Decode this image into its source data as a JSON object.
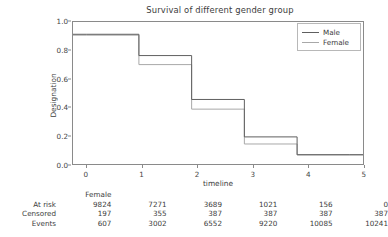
{
  "chart_data": {
    "type": "line",
    "title": "Survival of different gender group",
    "xlabel": "timeline",
    "ylabel": "Designation",
    "xlim": [
      -0.25,
      5.25
    ],
    "ylim": [
      -0.05,
      1.05
    ],
    "grid": false,
    "legend_position": "upper right",
    "x_ticks": [
      "0",
      "1",
      "2",
      "3",
      "4",
      "5"
    ],
    "x_tick_values": [
      0,
      1,
      2,
      3,
      4,
      5
    ],
    "y_ticks": [
      "0.0",
      "0.2",
      "0.4",
      "0.6",
      "0.8",
      "1.0"
    ],
    "y_tick_values": [
      0.0,
      0.2,
      0.4,
      0.6,
      0.8,
      1.0
    ],
    "step_style": "post",
    "series": [
      {
        "name": "Male",
        "color": "#5f5f5f",
        "x": [
          0,
          1,
          2,
          3,
          4,
          5
        ],
        "values": [
          0.955,
          0.79,
          0.45,
          0.16,
          0.022,
          0.022
        ]
      },
      {
        "name": "Female",
        "color": "#a8a8a8",
        "x": [
          0,
          1,
          2,
          3,
          4,
          5
        ],
        "values": [
          0.948,
          0.72,
          0.375,
          0.105,
          0.02,
          0.02
        ]
      }
    ]
  },
  "legend": {
    "entries": [
      {
        "label": "Male",
        "color": "#5f5f5f"
      },
      {
        "label": "Female",
        "color": "#a8a8a8"
      }
    ]
  },
  "risk_table": {
    "group_header": "Female",
    "row_labels": [
      "At risk",
      "Censored",
      "Events"
    ],
    "rows": [
      {
        "label": "At risk",
        "values": [
          "9824",
          "7271",
          "3689",
          "1021",
          "156",
          "0"
        ]
      },
      {
        "label": "Censored",
        "values": [
          "197",
          "355",
          "387",
          "387",
          "387",
          "387"
        ]
      },
      {
        "label": "Events",
        "values": [
          "607",
          "3002",
          "6552",
          "9220",
          "10085",
          "10241"
        ]
      }
    ]
  },
  "colors": {
    "background": "#ffffff",
    "axis": "#8a8a8a",
    "text": "#3c3c3c",
    "male_line": "#5f5f5f",
    "female_line": "#a8a8a8"
  }
}
